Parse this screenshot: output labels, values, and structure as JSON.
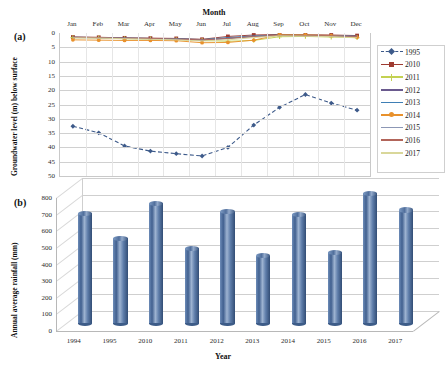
{
  "figure": {
    "panel_a_label": "(a)",
    "panel_b_label": "(b)"
  },
  "chart_data": [
    {
      "type": "line",
      "panel": "(a)",
      "title": "Month",
      "xlabel": "Month",
      "ylabel": "Groundwater level (m) below surface",
      "x_axis_position": "top",
      "y_axis_inverted": true,
      "ylim": [
        0,
        50
      ],
      "yticks": [
        0,
        5,
        10,
        15,
        20,
        25,
        30,
        35,
        40,
        45,
        50
      ],
      "grid": true,
      "legend_position": "right",
      "categories": [
        "Jan",
        "Feb",
        "Mar",
        "Apr",
        "May",
        "Jun",
        "Jul",
        "Aug",
        "Sep",
        "Oct",
        "Nov",
        "Dec"
      ],
      "series": [
        {
          "name": "1995",
          "color": "#3d5a8a",
          "marker": "diamond",
          "dash": true,
          "values": [
            32.6,
            34.9,
            39.5,
            41.3,
            42.2,
            43.0,
            40.0,
            32.2,
            26.0,
            21.5,
            24.5,
            27.0
          ]
        },
        {
          "name": "2010",
          "color": "#9e3b31",
          "marker": "square",
          "dash": false,
          "values": [
            1.4,
            1.5,
            1.7,
            1.8,
            1.9,
            2.2,
            1.2,
            0.7,
            0.5,
            0.6,
            0.7,
            0.9
          ]
        },
        {
          "name": "2011",
          "color": "#c3d152",
          "marker": "cross",
          "dash": false,
          "values": [
            1.6,
            1.7,
            2.0,
            2.1,
            2.3,
            2.6,
            2.9,
            2.6,
            1.3,
            1.2,
            1.4,
            1.6
          ]
        },
        {
          "name": "2012",
          "color": "#6a5a8e",
          "marker": "none",
          "dash": false,
          "values": [
            1.5,
            1.6,
            1.8,
            1.9,
            2.1,
            2.4,
            1.8,
            1.2,
            0.8,
            0.9,
            1.0,
            1.2
          ]
        },
        {
          "name": "2013",
          "color": "#3f7fb5",
          "marker": "none",
          "dash": false,
          "values": [
            1.5,
            1.6,
            1.8,
            1.9,
            2.0,
            2.3,
            1.6,
            1.0,
            0.7,
            0.8,
            0.9,
            1.1
          ]
        },
        {
          "name": "2014",
          "color": "#e8912c",
          "marker": "circle",
          "dash": false,
          "values": [
            2.4,
            2.5,
            2.6,
            2.6,
            2.7,
            3.4,
            3.3,
            2.5,
            0.6,
            0.7,
            0.9,
            1.5
          ]
        },
        {
          "name": "2015",
          "color": "#8c97b5",
          "marker": "none",
          "dash": false,
          "values": [
            1.6,
            1.7,
            1.9,
            2.0,
            2.2,
            2.5,
            2.0,
            1.3,
            0.9,
            1.0,
            1.1,
            1.3
          ]
        },
        {
          "name": "2016",
          "color": "#b2655a",
          "marker": "none",
          "dash": false,
          "values": [
            1.5,
            1.6,
            1.8,
            1.9,
            2.1,
            2.4,
            1.9,
            1.2,
            0.8,
            0.9,
            1.0,
            1.2
          ]
        },
        {
          "name": "2017",
          "color": "#d9d79a",
          "marker": "none",
          "dash": false,
          "values": [
            1.7,
            1.8,
            2.0,
            2.2,
            2.4,
            2.8,
            2.4,
            1.6,
            1.0,
            1.1,
            1.3,
            1.7
          ]
        }
      ]
    },
    {
      "type": "bar",
      "panel": "(b)",
      "title": "",
      "xlabel": "Year",
      "ylabel": "Annual average rainfall (mm)",
      "ylim": [
        0,
        800
      ],
      "yticks": [
        0,
        100,
        200,
        300,
        400,
        500,
        600,
        700,
        800
      ],
      "grid": true,
      "bar_style": "3d-cylinder",
      "bar_color": "#4a6e9e",
      "categories": [
        "1994",
        "1995",
        "2010",
        "2011",
        "2012",
        "2013",
        "2014",
        "2015",
        "2016",
        "2017"
      ],
      "values": [
        660,
        510,
        720,
        450,
        670,
        405,
        655,
        425,
        780,
        680
      ]
    }
  ]
}
